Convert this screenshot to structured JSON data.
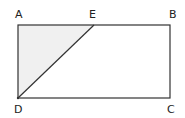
{
  "diagram": {
    "points": {
      "A": {
        "label": "A"
      },
      "B": {
        "label": "B"
      },
      "C": {
        "label": "C"
      },
      "D": {
        "label": "D"
      },
      "E": {
        "label": "E"
      }
    },
    "shapes": [
      {
        "type": "rectangle",
        "vertices": [
          "A",
          "B",
          "C",
          "D"
        ]
      },
      {
        "type": "segment",
        "from": "D",
        "to": "E"
      },
      {
        "type": "shaded-triangle",
        "vertices": [
          "A",
          "E",
          "D"
        ],
        "fill": "#f0f0f0"
      }
    ],
    "colors": {
      "stroke": "#333333",
      "shade": "#f0f0f0"
    }
  }
}
